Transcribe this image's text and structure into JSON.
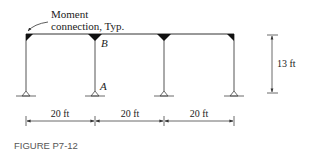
{
  "figure": {
    "caption": "FIGURE P7-12"
  },
  "annotation": {
    "line1": "Moment",
    "line2": "connection, Typ."
  },
  "labels": {
    "point_b": "B",
    "point_a": "A"
  },
  "dimensions": {
    "spans": [
      "20 ft",
      "20 ft",
      "20 ft"
    ],
    "height": "13 ft"
  },
  "structure": {
    "type": "multi-bay rigid frame",
    "bays": 3,
    "columns": 4,
    "supports": [
      "pin",
      "pin",
      "pin",
      "pin"
    ],
    "moment_connections_at": [
      "column-1-top",
      "column-2-top",
      "column-3-top",
      "column-4-top"
    ],
    "line_color": "#333333",
    "connection_fill": "#111111"
  }
}
